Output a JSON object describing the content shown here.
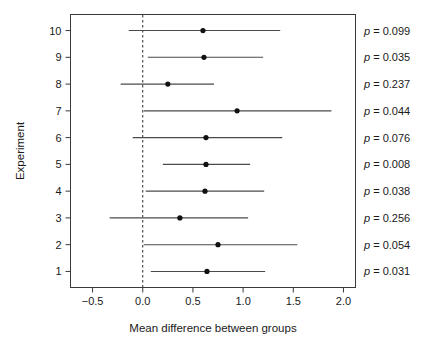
{
  "chart_data": {
    "type": "scatter",
    "subtype": "forest-plot",
    "title": "",
    "xlabel": "Mean difference between groups",
    "ylabel": "Experiment",
    "xlim": [
      -0.72,
      2.12
    ],
    "ylim": [
      0.4,
      10.6
    ],
    "grid": false,
    "legend": null,
    "xticks": [
      -0.5,
      0.0,
      0.5,
      1.0,
      1.5,
      2.0
    ],
    "xtick_labels": [
      "−0.5",
      "0.0",
      "0.5",
      "1.0",
      "1.5",
      "2.0"
    ],
    "yticks": [
      1,
      2,
      3,
      4,
      5,
      6,
      7,
      8,
      9,
      10
    ],
    "ytick_labels": [
      "1",
      "2",
      "3",
      "4",
      "5",
      "6",
      "7",
      "8",
      "9",
      "10"
    ],
    "reference_line": {
      "x": 0.0,
      "style": "dashed"
    },
    "categories": [
      "1",
      "2",
      "3",
      "4",
      "5",
      "6",
      "7",
      "8",
      "9",
      "10"
    ],
    "series": [
      {
        "name": "Mean difference with 95% CI",
        "points": [
          {
            "experiment": 10,
            "estimate": 0.6,
            "ci_low": -0.14,
            "ci_high": 1.37,
            "p_label": "p = 0.099",
            "p_value": 0.099
          },
          {
            "experiment": 9,
            "estimate": 0.61,
            "ci_low": 0.05,
            "ci_high": 1.2,
            "p_label": "p = 0.035",
            "p_value": 0.035
          },
          {
            "experiment": 8,
            "estimate": 0.25,
            "ci_low": -0.22,
            "ci_high": 0.71,
            "p_label": "p = 0.237",
            "p_value": 0.237
          },
          {
            "experiment": 7,
            "estimate": 0.94,
            "ci_low": 0.01,
            "ci_high": 1.88,
            "p_label": "p = 0.044",
            "p_value": 0.044
          },
          {
            "experiment": 6,
            "estimate": 0.63,
            "ci_low": -0.1,
            "ci_high": 1.39,
            "p_label": "p = 0.076",
            "p_value": 0.076
          },
          {
            "experiment": 5,
            "estimate": 0.63,
            "ci_low": 0.2,
            "ci_high": 1.07,
            "p_label": "p = 0.008",
            "p_value": 0.008
          },
          {
            "experiment": 4,
            "estimate": 0.62,
            "ci_low": 0.03,
            "ci_high": 1.21,
            "p_label": "p = 0.038",
            "p_value": 0.038
          },
          {
            "experiment": 3,
            "estimate": 0.37,
            "ci_low": -0.33,
            "ci_high": 1.05,
            "p_label": "p = 0.256",
            "p_value": 0.256
          },
          {
            "experiment": 2,
            "estimate": 0.75,
            "ci_low": 0.01,
            "ci_high": 1.54,
            "p_label": "p = 0.054",
            "p_value": 0.054
          },
          {
            "experiment": 1,
            "estimate": 0.64,
            "ci_low": 0.08,
            "ci_high": 1.22,
            "p_label": "p = 0.031",
            "p_value": 0.031
          }
        ]
      }
    ],
    "annotations": {
      "p_value_column": [
        "p = 0.099",
        "p = 0.035",
        "p = 0.237",
        "p = 0.044",
        "p = 0.076",
        "p = 0.008",
        "p = 0.038",
        "p = 0.256",
        "p = 0.054",
        "p = 0.031"
      ]
    },
    "colors": {
      "point": "#111111",
      "line": "#4a4a4a",
      "axis": "#3a3a3a",
      "reference": "#2a2a2a",
      "background": "#ffffff",
      "text": "#1a1a1a"
    }
  }
}
